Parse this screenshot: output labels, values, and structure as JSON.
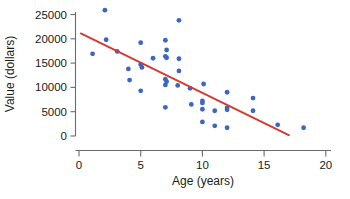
{
  "chart_data": {
    "type": "scatter",
    "title": "",
    "xlabel": "Age (years)",
    "ylabel": "Value (dollars)",
    "xlim": [
      0,
      20
    ],
    "ylim": [
      0,
      26500
    ],
    "xticks": [
      0,
      5,
      10,
      15,
      20
    ],
    "yticks": [
      0,
      5000,
      10000,
      15000,
      20000,
      25000
    ],
    "xtick_labels": [
      "0",
      "5",
      "10",
      "15",
      "20"
    ],
    "ytick_labels": [
      "0",
      "5000",
      "10000",
      "15000",
      "20000",
      "25000"
    ],
    "grid": false,
    "legend": null,
    "point_color": "#3a66c4",
    "line_color": "#d6392f",
    "points": [
      {
        "x": 1.1,
        "y": 16900
      },
      {
        "x": 2.1,
        "y": 25900
      },
      {
        "x": 2.2,
        "y": 19800
      },
      {
        "x": 3.1,
        "y": 17400
      },
      {
        "x": 4.0,
        "y": 13800
      },
      {
        "x": 4.1,
        "y": 11500
      },
      {
        "x": 5.0,
        "y": 19200
      },
      {
        "x": 5.0,
        "y": 14700
      },
      {
        "x": 5.1,
        "y": 14100
      },
      {
        "x": 5.0,
        "y": 9300
      },
      {
        "x": 6.0,
        "y": 16000
      },
      {
        "x": 7.0,
        "y": 19700
      },
      {
        "x": 7.1,
        "y": 17700
      },
      {
        "x": 7.0,
        "y": 16400
      },
      {
        "x": 7.1,
        "y": 16100
      },
      {
        "x": 7.0,
        "y": 11700
      },
      {
        "x": 7.1,
        "y": 11200
      },
      {
        "x": 7.0,
        "y": 10500
      },
      {
        "x": 7.0,
        "y": 5900
      },
      {
        "x": 8.1,
        "y": 23800
      },
      {
        "x": 8.1,
        "y": 15900
      },
      {
        "x": 8.1,
        "y": 13400
      },
      {
        "x": 8.0,
        "y": 10400
      },
      {
        "x": 9.0,
        "y": 9800
      },
      {
        "x": 9.1,
        "y": 6500
      },
      {
        "x": 10.1,
        "y": 10700
      },
      {
        "x": 10.0,
        "y": 7200
      },
      {
        "x": 10.0,
        "y": 6800
      },
      {
        "x": 10.0,
        "y": 5500
      },
      {
        "x": 10.0,
        "y": 2900
      },
      {
        "x": 11.0,
        "y": 5200
      },
      {
        "x": 11.0,
        "y": 2100
      },
      {
        "x": 12.0,
        "y": 9000
      },
      {
        "x": 12.0,
        "y": 5800
      },
      {
        "x": 12.0,
        "y": 5400
      },
      {
        "x": 12.0,
        "y": 1700
      },
      {
        "x": 14.1,
        "y": 7800
      },
      {
        "x": 14.1,
        "y": 5200
      },
      {
        "x": 16.1,
        "y": 2300
      },
      {
        "x": 18.2,
        "y": 1700
      }
    ],
    "trend_line": {
      "x1": 0.15,
      "y1": 21100,
      "x2": 17.0,
      "y2": 200
    }
  }
}
